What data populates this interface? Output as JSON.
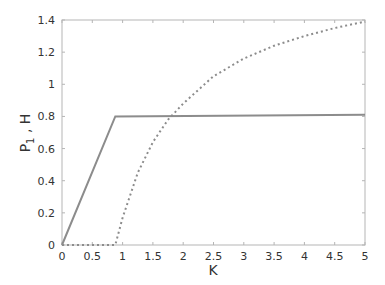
{
  "chart_data": {
    "type": "line",
    "title": "",
    "xlabel": "K",
    "ylabel": "P1 , H",
    "xlim": [
      0,
      5
    ],
    "ylim": [
      0,
      1.4
    ],
    "xticks": [
      "0",
      "0.5",
      "1",
      "1.5",
      "2",
      "2.5",
      "3",
      "3.5",
      "4",
      "4.5",
      "5"
    ],
    "yticks": [
      "0",
      "0.2",
      "0.4",
      "0.6",
      "0.8",
      "1",
      "1.2",
      "1.4"
    ],
    "grid": false,
    "legend": null,
    "series": [
      {
        "name": "P1",
        "style": "solid",
        "color": "#8c8c8c",
        "x": [
          0,
          0.88,
          5
        ],
        "y": [
          0,
          0.8,
          0.81
        ]
      },
      {
        "name": "H",
        "style": "dotted",
        "color": "#8c8c8c",
        "x": [
          0,
          0.88,
          1.0,
          1.25,
          1.5,
          1.75,
          2.0,
          2.5,
          3.0,
          3.5,
          4.0,
          4.5,
          5.0
        ],
        "y": [
          0,
          0,
          0.17,
          0.45,
          0.64,
          0.78,
          0.88,
          1.05,
          1.16,
          1.24,
          1.3,
          1.35,
          1.39
        ]
      }
    ]
  }
}
